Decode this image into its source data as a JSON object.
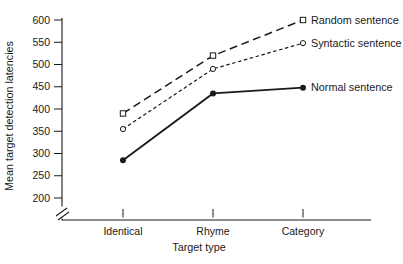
{
  "chart_data": {
    "type": "line",
    "title": "",
    "xlabel": "Target type",
    "ylabel": "Mean target detection latencies",
    "categories": [
      "Identical",
      "Rhyme",
      "Category"
    ],
    "y_ticks": [
      200,
      250,
      300,
      350,
      400,
      450,
      500,
      550,
      600
    ],
    "ylim": [
      200,
      600
    ],
    "axis_break": true,
    "grid": false,
    "legend_position": "labels-at-line-ends",
    "axis_color": "#1a1a1a",
    "series": [
      {
        "name": "Random sentence",
        "values": [
          390,
          520,
          600
        ],
        "line_style": "long-dash",
        "marker": "open-square",
        "color": "#1a1a1a"
      },
      {
        "name": "Syntactic sentence",
        "values": [
          355,
          490,
          548
        ],
        "line_style": "short-dash",
        "marker": "open-circle",
        "color": "#1a1a1a"
      },
      {
        "name": "Normal sentence",
        "values": [
          285,
          435,
          448
        ],
        "line_style": "solid",
        "marker": "filled-circle",
        "color": "#1a1a1a"
      }
    ]
  }
}
